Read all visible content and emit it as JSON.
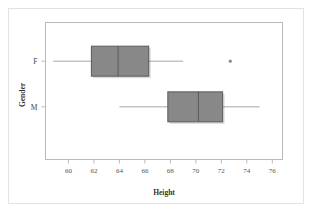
{
  "figure": {
    "background_color": "#ffffff",
    "border_color": "#e3e3e3",
    "frame_color": "#b9b9b9"
  },
  "chart_data": {
    "type": "boxplot",
    "orientation": "horizontal",
    "title": "",
    "xlabel": "Height",
    "ylabel": "Gender",
    "xlim": [
      58.2,
      76.8
    ],
    "xticks": [
      60,
      62,
      64,
      66,
      68,
      70,
      72,
      74,
      76
    ],
    "xticklabels": [
      "60",
      "62",
      "64",
      "66",
      "68",
      "70",
      "72",
      "74",
      "76"
    ],
    "categories": [
      "F",
      "M"
    ],
    "grid": false,
    "legend": null,
    "box_fill_color": "#888888",
    "box_edge_color": "#5a5a5a",
    "whisker_color": "#a8a8a8",
    "median_color": "#5a5a5a",
    "outlier_color": "#8a8a8a",
    "boxes": [
      {
        "category": "F",
        "min": 58.8,
        "q1": 61.8,
        "median": 63.9,
        "q3": 66.3,
        "max": 69.0,
        "outliers": [
          72.7
        ]
      },
      {
        "category": "M",
        "min": 64.0,
        "q1": 67.8,
        "median": 70.2,
        "q3": 72.1,
        "max": 75.0,
        "outliers": []
      }
    ]
  }
}
